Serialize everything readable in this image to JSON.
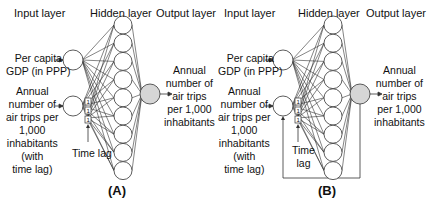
{
  "panels": [
    {
      "id": "A",
      "caption": "(A)",
      "headers": {
        "input": "Input layer",
        "hidden": "Hidden layer",
        "output": "Output layer"
      },
      "inputs": [
        {
          "label_lines": [
            "Per capita",
            "GDP (in PPP)"
          ]
        },
        {
          "label_lines": [
            "Annual",
            "number of",
            "air trips per",
            "1,000",
            "inhabitants",
            "(with",
            "time lag)"
          ]
        }
      ],
      "time_lag": {
        "label_lines": [
          "Time lag"
        ],
        "delay_boxes": [
          "1",
          "1",
          "1"
        ]
      },
      "hidden_neuron_count": 9,
      "output": {
        "label_lines": [
          "Annual",
          "number of",
          "air trips",
          "per 1,000",
          "inhabitants"
        ]
      },
      "feedback_loop": false
    },
    {
      "id": "B",
      "caption": "(B)",
      "headers": {
        "input": "Input layer",
        "hidden": "Hidden layer",
        "output": "Output layer"
      },
      "inputs": [
        {
          "label_lines": [
            "Per capita",
            "GDP (in PPP)"
          ]
        },
        {
          "label_lines": [
            "Annual",
            "number of",
            "air trips per",
            "1,000",
            "inhabitants",
            "(with",
            "time lag)"
          ]
        }
      ],
      "time_lag": {
        "label_lines": [
          "Time",
          "lag"
        ],
        "delay_boxes": [
          "1",
          "1",
          "1"
        ]
      },
      "hidden_neuron_count": 9,
      "output": {
        "label_lines": [
          "Annual",
          "number of",
          "air trips",
          "per 1,000",
          "inhabitants"
        ]
      },
      "feedback_loop": true
    }
  ],
  "colors": {
    "line": "#333333",
    "node_fill": "#ffffff",
    "output_fill": "#d6d6d6",
    "text": "#111111"
  }
}
